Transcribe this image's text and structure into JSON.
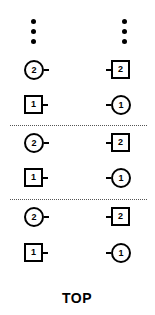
{
  "diagram": {
    "type": "connector-pin-layout",
    "continuation": "vertical-ellipsis",
    "columns": [
      "left",
      "right"
    ],
    "groups": [
      {
        "rows": [
          {
            "left": {
              "shape": "circle",
              "label": "2",
              "stub": "right"
            },
            "right": {
              "shape": "square",
              "label": "2",
              "stub": "left"
            }
          },
          {
            "left": {
              "shape": "square",
              "label": "1",
              "stub": "right"
            },
            "right": {
              "shape": "circle",
              "label": "1",
              "stub": "left"
            }
          }
        ]
      },
      {
        "rows": [
          {
            "left": {
              "shape": "circle",
              "label": "2",
              "stub": "right"
            },
            "right": {
              "shape": "square",
              "label": "2",
              "stub": "left"
            }
          },
          {
            "left": {
              "shape": "square",
              "label": "1",
              "stub": "right"
            },
            "right": {
              "shape": "circle",
              "label": "1",
              "stub": "left"
            }
          }
        ]
      },
      {
        "rows": [
          {
            "left": {
              "shape": "circle",
              "label": "2",
              "stub": "right"
            },
            "right": {
              "shape": "square",
              "label": "2",
              "stub": "left"
            }
          },
          {
            "left": {
              "shape": "square",
              "label": "1",
              "stub": "right"
            },
            "right": {
              "shape": "circle",
              "label": "1",
              "stub": "left"
            }
          }
        ]
      }
    ],
    "footer_label": "TOP",
    "colors": {
      "stroke": "#000000",
      "background": "#ffffff",
      "divider": "#555555"
    }
  }
}
